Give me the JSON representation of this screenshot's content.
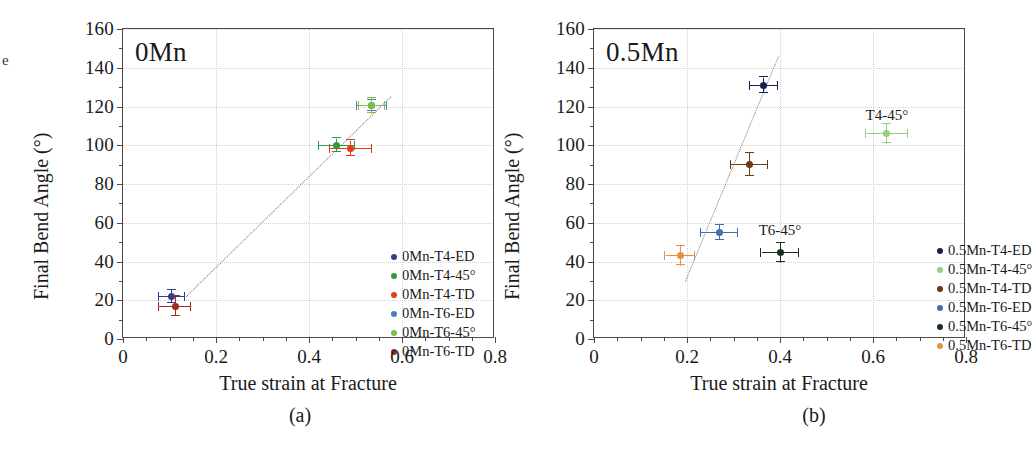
{
  "figure": {
    "edge_artifact": "e",
    "panels": [
      {
        "caption": "(a)",
        "title": "0Mn",
        "axes": {
          "xlabel": "True strain at Fracture",
          "ylabel": "Final Bend Angle (°)",
          "xticks": [
            "0",
            "0.2",
            "0.4",
            "0.6",
            "0.8"
          ],
          "yticks": [
            "0",
            "20",
            "40",
            "60",
            "80",
            "100",
            "120",
            "140",
            "160"
          ]
        },
        "legend": [
          {
            "label": "0Mn-T4-ED",
            "color": "#2f3f87"
          },
          {
            "label": "0Mn-T4-45°",
            "color": "#2e9c3c"
          },
          {
            "label": "0Mn-T4-TD",
            "color": "#e03c1c"
          },
          {
            "label": "0Mn-T6-ED",
            "color": "#4a7fc1"
          },
          {
            "label": "0Mn-T6-45°",
            "color": "#7bbf4a"
          },
          {
            "label": "0Mn-T6-TD",
            "color": "#9e2b1e"
          }
        ],
        "annotations": []
      },
      {
        "caption": "(b)",
        "title": "0.5Mn",
        "axes": {
          "xlabel": "True strain at Fracture",
          "ylabel": "Final Bend Angle (°)",
          "xticks": [
            "0",
            "0.2",
            "0.4",
            "0.6",
            "0.8"
          ],
          "yticks": [
            "0",
            "20",
            "40",
            "60",
            "80",
            "100",
            "120",
            "140",
            "160"
          ]
        },
        "legend": [
          {
            "label": "0.5Mn-T4-ED",
            "color": "#15204f"
          },
          {
            "label": "0.5Mn-T4-45°",
            "color": "#96cd7f"
          },
          {
            "label": "0.5Mn-T4-TD",
            "color": "#6b3a16"
          },
          {
            "label": "0.5Mn-T6-ED",
            "color": "#3f6fae"
          },
          {
            "label": "0.5Mn-T6-45°",
            "color": "#17301c"
          },
          {
            "label": "0.5Mn-T6-TD",
            "color": "#e8913f"
          }
        ],
        "annotations": [
          {
            "text": "T4-45°",
            "x": 0.63,
            "y": 115
          },
          {
            "text": "T6-45°",
            "x": 0.4,
            "y": 56
          }
        ]
      }
    ]
  },
  "chart_data": [
    {
      "type": "scatter",
      "title": "0Mn",
      "caption": "(a)",
      "xlabel": "True strain at Fracture",
      "ylabel": "Final Bend Angle (°)",
      "xlim": [
        0,
        0.8
      ],
      "ylim": [
        0,
        160
      ],
      "xticks": [
        0,
        0.2,
        0.4,
        0.6,
        0.8
      ],
      "yticks": [
        0,
        20,
        40,
        60,
        80,
        100,
        120,
        140,
        160
      ],
      "grid": true,
      "legend_position": "inside-right",
      "trendline": {
        "style": "dotted",
        "x": [
          0.135,
          0.575
        ],
        "y": [
          22,
          125
        ]
      },
      "series": [
        {
          "name": "0Mn-T4-ED",
          "color": "#2f3f87",
          "x": 0.105,
          "y": 22,
          "xerr": 0.028,
          "yerr": 3.5
        },
        {
          "name": "0Mn-T4-45°",
          "color": "#2e9c3c",
          "x": 0.46,
          "y": 100,
          "xerr": 0.038,
          "yerr": 3.5
        },
        {
          "name": "0Mn-T4-TD",
          "color": "#e03c1c",
          "x": 0.49,
          "y": 98.5,
          "xerr": 0.045,
          "yerr": 4
        },
        {
          "name": "0Mn-T6-ED",
          "color": "#4a7fc1",
          "x": 0.535,
          "y": 120.5,
          "xerr": 0.032,
          "yerr": 3
        },
        {
          "name": "0Mn-T6-45°",
          "color": "#7bbf4a",
          "x": 0.535,
          "y": 120.5,
          "xerr": 0.028,
          "yerr": 4
        },
        {
          "name": "0Mn-T6-TD",
          "color": "#9e2b1e",
          "x": 0.112,
          "y": 17,
          "xerr": 0.035,
          "yerr": 5
        }
      ]
    },
    {
      "type": "scatter",
      "title": "0.5Mn",
      "caption": "(b)",
      "xlabel": "True strain at Fracture",
      "ylabel": "Final Bend Angle (°)",
      "xlim": [
        0,
        0.8
      ],
      "ylim": [
        0,
        160
      ],
      "xticks": [
        0,
        0.2,
        0.4,
        0.6,
        0.8
      ],
      "yticks": [
        0,
        20,
        40,
        60,
        80,
        100,
        120,
        140,
        160
      ],
      "grid": true,
      "legend_position": "inside-right",
      "trendline": {
        "style": "dotted",
        "x": [
          0.195,
          0.395
        ],
        "y": [
          30,
          146
        ]
      },
      "series": [
        {
          "name": "0.5Mn-T4-ED",
          "color": "#15204f",
          "x": 0.365,
          "y": 131,
          "xerr": 0.03,
          "yerr": 4
        },
        {
          "name": "0.5Mn-T4-45°",
          "color": "#96cd7f",
          "x": 0.63,
          "y": 106,
          "xerr": 0.045,
          "yerr": 5
        },
        {
          "name": "0.5Mn-T4-TD",
          "color": "#6b3a16",
          "x": 0.335,
          "y": 90,
          "xerr": 0.04,
          "yerr": 6
        },
        {
          "name": "0.5Mn-T6-ED",
          "color": "#3f6fae",
          "x": 0.27,
          "y": 55,
          "xerr": 0.04,
          "yerr": 4
        },
        {
          "name": "0.5Mn-T6-45°",
          "color": "#17301c",
          "x": 0.4,
          "y": 44.5,
          "xerr": 0.04,
          "yerr": 5
        },
        {
          "name": "0.5Mn-T6-TD",
          "color": "#e8913f",
          "x": 0.185,
          "y": 43,
          "xerr": 0.032,
          "yerr": 5
        }
      ]
    }
  ]
}
